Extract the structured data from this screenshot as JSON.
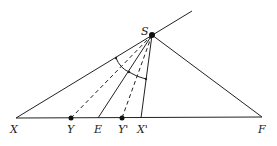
{
  "diagram": {
    "type": "geometry",
    "points": [
      {
        "id": "S",
        "label": "S",
        "x": 152,
        "y": 35,
        "dot": true
      },
      {
        "id": "X",
        "label": "X",
        "x": 16,
        "y": 118,
        "dot": false
      },
      {
        "id": "Y",
        "label": "Y",
        "x": 71,
        "y": 118,
        "dot": true
      },
      {
        "id": "E",
        "label": "E",
        "x": 98,
        "y": 118,
        "dot": false
      },
      {
        "id": "Yp",
        "label": "Y'",
        "x": 122,
        "y": 118,
        "dot": true
      },
      {
        "id": "Xp",
        "label": "X'",
        "x": 141,
        "y": 118,
        "dot": false
      },
      {
        "id": "F",
        "label": "F",
        "x": 262,
        "y": 118,
        "dot": false
      }
    ],
    "solid_lines": [
      [
        "X",
        "F"
      ],
      [
        "X",
        "S"
      ],
      [
        "S",
        "F"
      ],
      [
        "S",
        "E"
      ],
      [
        "S",
        "Xp"
      ]
    ],
    "dashed_lines": [
      [
        "S",
        "Y"
      ],
      [
        "S",
        "Yp"
      ]
    ],
    "ray_extension": {
      "from": "S",
      "to_x": 192,
      "to_y": 11
    },
    "arc": {
      "center": "S",
      "description": "angle arcs between SX and SX' with tick at SE"
    }
  }
}
